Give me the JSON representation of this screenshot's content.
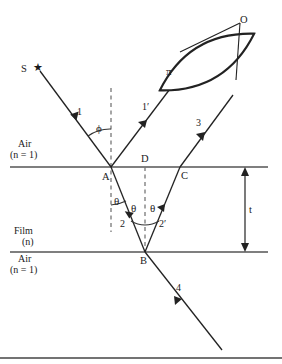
{
  "figure": {
    "colors": {
      "line": "#222222",
      "interface": "#555555",
      "dashed": "#666666",
      "background": "#ffffff",
      "border": "#444444"
    }
  },
  "source": {
    "label": "S",
    "icon": "star-icon",
    "glyph": "★"
  },
  "observer": {
    "label": "O"
  },
  "lens": {
    "label": "π"
  },
  "rays": [
    {
      "id": "ray-1",
      "label": "1",
      "desc": "incident ray from source to point A"
    },
    {
      "id": "ray-1p",
      "label": "1′",
      "desc": "reflected ray from A toward lens"
    },
    {
      "id": "ray-2",
      "label": "2",
      "desc": "refracted ray inside film from A to B"
    },
    {
      "id": "ray-2p",
      "label": "2′",
      "desc": "internally reflected ray from B to C"
    },
    {
      "id": "ray-3",
      "label": "3",
      "desc": "ray emerging at C toward lens"
    },
    {
      "id": "ray-4",
      "label": "4",
      "desc": "transmitted ray below film from B"
    }
  ],
  "points": [
    {
      "id": "point-A",
      "label": "A"
    },
    {
      "id": "point-B",
      "label": "B"
    },
    {
      "id": "point-C",
      "label": "C"
    },
    {
      "id": "point-D",
      "label": "D"
    }
  ],
  "angles": [
    {
      "id": "angle-phi",
      "label": "ϕ",
      "desc": "angle of incidence at A"
    },
    {
      "id": "angle-theta-a",
      "label": "θ",
      "desc": "refraction angle at A"
    },
    {
      "id": "angle-theta-b-left",
      "label": "θ",
      "desc": "incidence angle at B"
    },
    {
      "id": "angle-theta-b-right",
      "label": "θ",
      "desc": "reflection angle at B"
    }
  ],
  "media": {
    "top": {
      "line1": "Air",
      "line2": "(n = 1)"
    },
    "film": {
      "line1": "Film",
      "line2": "(n)"
    },
    "bottom": {
      "line1": "Air",
      "line2": "(n = 1)"
    }
  },
  "thickness": {
    "label": "t",
    "desc": "film thickness double headed arrow"
  }
}
